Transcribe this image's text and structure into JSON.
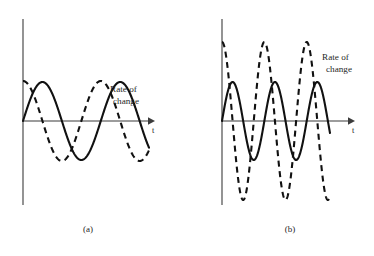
{
  "figure": {
    "background": "#ffffff",
    "ink": "#111111",
    "axis_color": "#3b3b3b",
    "width": 374,
    "height": 256
  },
  "chart_data": {
    "type": "line",
    "title": "",
    "xlabel": "t",
    "ylabel": "",
    "grid": false,
    "legend_position": "inline-annotation",
    "panels": [
      {
        "id": "a",
        "caption": "(a)",
        "caption_x": 88,
        "caption_y": 232,
        "origin_x": 23,
        "origin_y": 121,
        "x_axis_end": 152,
        "y_axis_top": 19,
        "y_axis_bottom": 205,
        "x_tick_label": "t",
        "x_tick_label_x": 152,
        "x_tick_label_y": 133,
        "annotation": "Rate of change",
        "annotation_line1": "Rate of",
        "annotation_line2": "change",
        "annotation_x": 110,
        "annotation_y": 92,
        "series": [
          {
            "name": "signal",
            "style": "solid",
            "amplitude": 39,
            "cycles": 1.62,
            "phase_deg": 0,
            "span_px": 126,
            "points_note": "starts at origin, rises to first peak ~x=47 y=82, crosses axis ~x=62, trough ~x=86 y=160, returns to axis ~x=110"
          },
          {
            "name": "rate-of-change",
            "style": "dashed",
            "amplitude": 40,
            "cycles": 1.62,
            "phase_deg": 90,
            "span_px": 126,
            "points_note": "leads the signal by a quarter cycle; starts near peak at left axis, trough ~x=65 y=163, second peak ~x=112 y=80"
          }
        ],
        "xlim": [
          0,
          126
        ],
        "ylim": [
          -44,
          44
        ]
      },
      {
        "id": "b",
        "caption": "(b)",
        "caption_x": 290,
        "caption_y": 232,
        "origin_x": 222,
        "origin_y": 121,
        "x_axis_end": 352,
        "y_axis_top": 19,
        "y_axis_bottom": 205,
        "x_tick_label": "t",
        "x_tick_label_x": 352,
        "x_tick_label_y": 133,
        "annotation": "Rate of change",
        "annotation_line1": "Rate of",
        "annotation_line2": "change",
        "annotation_x": 322,
        "annotation_y": 60,
        "series": [
          {
            "name": "signal",
            "style": "solid",
            "amplitude": 39,
            "cycles": 2.55,
            "phase_deg": 0,
            "span_px": 108,
            "points_note": "higher frequency, same amplitude as panel (a) signal; peaks ~y=82, troughs ~y=158"
          },
          {
            "name": "rate-of-change",
            "style": "dashed",
            "amplitude": 79,
            "cycles": 2.55,
            "phase_deg": 90,
            "span_px": 108,
            "points_note": "amplitude roughly doubled because frequency doubled; peaks ~y=42, troughs ~y=192"
          }
        ],
        "xlim": [
          0,
          108
        ],
        "ylim": [
          -86,
          86
        ]
      }
    ]
  }
}
